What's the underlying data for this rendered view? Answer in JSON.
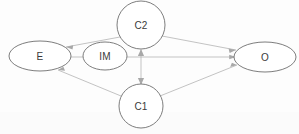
{
  "diagram": {
    "type": "path-diagram",
    "title": "",
    "background_color": "#fdfdfd",
    "node_stroke_color": "#6e6e6e",
    "edge_color": "#b4b4b4",
    "label_color": "#3a3a3a",
    "nodes": [
      {
        "id": "E",
        "label": "E",
        "shape": "ellipse",
        "cx": 40,
        "cy": 56,
        "rx": 31,
        "ry": 15
      },
      {
        "id": "IM",
        "label": "IM",
        "shape": "ellipse",
        "cx": 105,
        "cy": 56,
        "rx": 22,
        "ry": 14
      },
      {
        "id": "C2",
        "label": "C2",
        "shape": "circle",
        "cx": 141,
        "cy": 25,
        "rx": 24,
        "ry": 24
      },
      {
        "id": "C1",
        "label": "C1",
        "shape": "circle",
        "cx": 141,
        "cy": 106,
        "rx": 22,
        "ry": 22
      },
      {
        "id": "O",
        "label": "O",
        "shape": "ellipse",
        "cx": 265,
        "cy": 57,
        "rx": 31,
        "ry": 15
      }
    ],
    "edges": [
      {
        "from": "C2",
        "to": "E",
        "arrow": "to",
        "style": "solid"
      },
      {
        "from": "C2",
        "to": "O",
        "arrow": "to",
        "style": "solid"
      },
      {
        "from": "C2",
        "to": "C1",
        "arrow": "both",
        "style": "solid"
      },
      {
        "from": "C1",
        "to": "E",
        "arrow": "to",
        "style": "solid"
      },
      {
        "from": "C1",
        "to": "O",
        "arrow": "to",
        "style": "solid"
      },
      {
        "from": "E",
        "to": "O",
        "arrow": "to",
        "style": "solid"
      }
    ]
  }
}
